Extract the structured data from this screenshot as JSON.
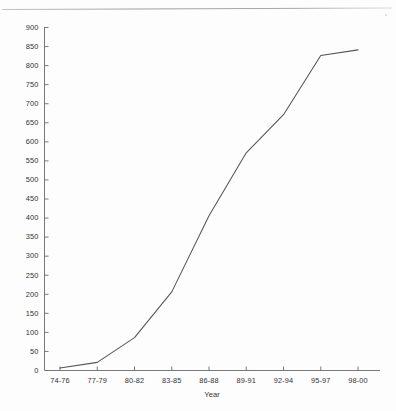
{
  "chart_data": {
    "type": "line",
    "title": "",
    "subtitle": "",
    "xlabel": "Year",
    "ylabel": "",
    "categories": [
      "74-76",
      "77-79",
      "80-82",
      "83-85",
      "86-88",
      "89-91",
      "92-94",
      "95-97",
      "98-00"
    ],
    "values": [
      5,
      20,
      85,
      205,
      405,
      570,
      670,
      825,
      840
    ],
    "series": [
      {
        "name": "",
        "values": [
          5,
          20,
          85,
          205,
          405,
          570,
          670,
          825,
          840
        ]
      }
    ],
    "ylim": [
      0,
      900
    ],
    "ytick_step": 50,
    "yticks": [
      0,
      50,
      100,
      150,
      200,
      250,
      300,
      350,
      400,
      450,
      500,
      550,
      600,
      650,
      700,
      750,
      800,
      850,
      900
    ],
    "ytick_labels": [
      "0",
      "50",
      "100",
      "150",
      "200",
      "250",
      "300",
      "350",
      "400",
      "450",
      "500",
      "550",
      "600",
      "650",
      "700",
      "750",
      "800",
      "850",
      "900"
    ],
    "grid": false,
    "legend": "none",
    "line_color": "#555555",
    "axis_color": "#6b6b6b",
    "background_color": "#fdfdfd",
    "markers": false
  },
  "figure": {
    "axis_title_x": "Year",
    "scan_artifact": "horizontal-scan-line"
  }
}
